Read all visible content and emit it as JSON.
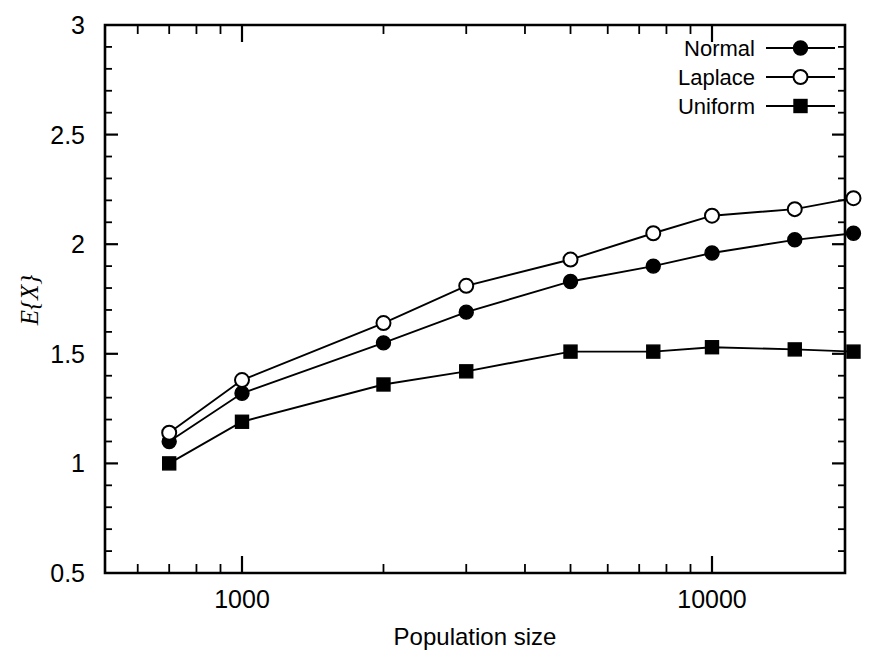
{
  "chart_data": {
    "type": "line",
    "title": "",
    "xlabel": "Population size",
    "ylabel": "E{X}",
    "ylabel_parts": {
      "symbol": "E",
      "brace_open": "{",
      "variable": "X",
      "brace_close": "}"
    },
    "xscale": "log",
    "yscale": "linear",
    "xlim": [
      700,
      21000
    ],
    "ylim": [
      0.5,
      3
    ],
    "grid": false,
    "legend_position": "top-right",
    "x_tick_labels": [
      "1000",
      "10000"
    ],
    "x_tick_values": [
      1000,
      10000
    ],
    "y_tick_labels": [
      "0.5",
      "1",
      "1.5",
      "2",
      "2.5",
      "3"
    ],
    "y_tick_values": [
      0.5,
      1,
      1.5,
      2,
      2.5,
      3
    ],
    "x": [
      700,
      1000,
      2000,
      3000,
      5000,
      7500,
      10000,
      15000,
      20000
    ],
    "series": [
      {
        "name": "Normal",
        "marker": "filled-circle",
        "color": "#000000",
        "values": [
          1.1,
          1.32,
          1.55,
          1.69,
          1.83,
          1.9,
          1.96,
          2.02,
          2.05
        ]
      },
      {
        "name": "Laplace",
        "marker": "open-circle",
        "color": "#000000",
        "values": [
          1.14,
          1.38,
          1.64,
          1.81,
          1.93,
          2.05,
          2.13,
          2.16,
          2.21
        ]
      },
      {
        "name": "Uniform",
        "marker": "filled-square",
        "color": "#000000",
        "values": [
          1.0,
          1.19,
          1.36,
          1.42,
          1.51,
          1.51,
          1.53,
          1.52,
          1.51
        ]
      }
    ]
  },
  "axis": {
    "y_labels": [
      "3",
      "2.5",
      "2",
      "1.5",
      "1",
      "0.5"
    ],
    "x_labels": [
      "1000",
      "10000"
    ],
    "x_title": "Population size"
  },
  "legend": {
    "items": [
      {
        "label": "Normal"
      },
      {
        "label": "Laplace"
      },
      {
        "label": "Uniform"
      }
    ]
  },
  "colors": {
    "ink": "#000000",
    "paper": "#ffffff"
  }
}
